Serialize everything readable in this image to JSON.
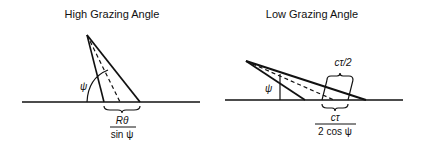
{
  "left_panel": {
    "title": "High Grazing Angle",
    "angle_label": "ψ",
    "footprint_numerator": "Rθ",
    "footprint_denominator": "sin ψ"
  },
  "right_panel": {
    "title": "Low Grazing Angle",
    "angle_label": "ψ",
    "pulse_label": "cτ/2",
    "footprint_numerator": "cτ",
    "footprint_denominator": "2 cos ψ"
  },
  "colors": {
    "ink": "#111111",
    "background": "#ffffff"
  }
}
